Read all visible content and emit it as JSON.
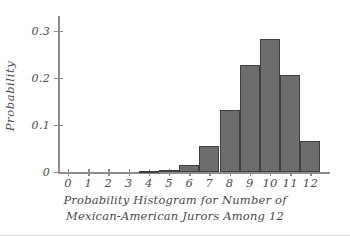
{
  "chart_data": {
    "type": "bar",
    "title": "",
    "caption_line1": "Probability Histogram for Number of",
    "caption_line2": "Mexican-American Jurors Among 12",
    "xlabel": "",
    "ylabel": "Probability",
    "categories": [
      "0",
      "1",
      "2",
      "3",
      "4",
      "5",
      "6",
      "7",
      "8",
      "9",
      "10",
      "11",
      "12"
    ],
    "values": [
      0.0,
      0.0,
      0.0,
      0.0,
      0.002,
      0.004,
      0.015,
      0.055,
      0.132,
      0.228,
      0.283,
      0.206,
      0.066
    ],
    "x_tick_labels": [
      "0",
      "1",
      "2",
      "3",
      "4",
      "5",
      "6",
      "7",
      "8",
      "9",
      "10",
      "11",
      "12"
    ],
    "y_tick_labels": [
      "0",
      "0.1",
      "0.2",
      "0.3"
    ],
    "y_tick_values": [
      0,
      0.1,
      0.2,
      0.3
    ],
    "ylim": [
      0,
      0.33
    ],
    "xlim": [
      -0.5,
      12.5
    ],
    "grid": false,
    "legend": null,
    "bar_fill_color": "#6d6d6d",
    "bar_edge_color": "#3f3f3f",
    "axis_color": "#8d8d8d",
    "text_color": "#4d4d4d",
    "background_color": "#ffffff"
  }
}
